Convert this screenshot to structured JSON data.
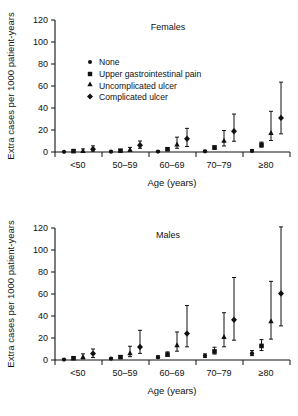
{
  "figure": {
    "background": "#ffffff",
    "ink_color": "#111111",
    "panels": [
      "females",
      "males"
    ]
  },
  "chart_data": [
    {
      "id": "females",
      "type": "scatter",
      "title": "Females",
      "xlabel": "Age (years)",
      "ylabel": "Extra cases per 1000 patient-years",
      "ylim": [
        0,
        120
      ],
      "yticks": [
        0,
        20,
        40,
        60,
        80,
        100,
        120
      ],
      "ytick_labels": [
        "0",
        "20",
        "40",
        "60",
        "80",
        "100",
        "120"
      ],
      "categories": [
        "<50",
        "50–59",
        "60–69",
        "70–79",
        "≥80"
      ],
      "grid": false,
      "legend": {
        "position": "upper-left-inside",
        "entries": [
          {
            "label": "None",
            "marker": "circle"
          },
          {
            "label": "Upper gastrointestinal pain",
            "marker": "square"
          },
          {
            "label": "Uncomplicated ulcer",
            "marker": "triangle"
          },
          {
            "label": "Complicated ulcer",
            "marker": "diamond"
          }
        ]
      },
      "series": [
        {
          "name": "None",
          "marker": "circle",
          "values": [
            0.2,
            0.3,
            0.4,
            0.6,
            1.0
          ],
          "lower": [
            0.0,
            0.0,
            0.0,
            0.1,
            0.3
          ],
          "upper": [
            0.5,
            0.8,
            1.0,
            1.5,
            2.2
          ]
        },
        {
          "name": "Upper gastrointestinal pain",
          "marker": "square",
          "values": [
            0.8,
            1.2,
            2.5,
            4.0,
            6.5
          ],
          "lower": [
            0.2,
            0.4,
            1.4,
            2.6,
            4.4
          ],
          "upper": [
            1.6,
            2.2,
            3.8,
            5.6,
            9.0
          ]
        },
        {
          "name": "Uncomplicated ulcer",
          "marker": "triangle",
          "values": [
            1.2,
            2.2,
            7.0,
            10.5,
            17.5
          ],
          "lower": [
            0.2,
            0.6,
            3.4,
            5.5,
            10.5
          ],
          "upper": [
            2.8,
            4.2,
            13.5,
            19.5,
            37.0
          ]
        },
        {
          "name": "Complicated ulcer",
          "marker": "diamond",
          "values": [
            2.6,
            6.2,
            12.0,
            18.8,
            31.0
          ],
          "lower": [
            0.8,
            3.4,
            5.0,
            9.8,
            16.5
          ],
          "upper": [
            5.6,
            10.0,
            21.5,
            34.5,
            63.5
          ]
        }
      ]
    },
    {
      "id": "males",
      "type": "scatter",
      "title": "Males",
      "xlabel": "Age (years)",
      "ylabel": "Extra cases per 1000 patient-years",
      "ylim": [
        0,
        120
      ],
      "yticks": [
        0,
        20,
        40,
        60,
        80,
        100,
        120
      ],
      "ytick_labels": [
        "0",
        "20",
        "40",
        "60",
        "80",
        "100",
        "120"
      ],
      "categories": [
        "<50",
        "50–59",
        "60–69",
        "70–79",
        "≥80"
      ],
      "grid": false,
      "legend": null,
      "series": [
        {
          "name": "None",
          "marker": "circle",
          "values": [
            0.4,
            1.2,
            2.6,
            3.8,
            6.0
          ],
          "lower": [
            0.0,
            0.5,
            1.6,
            2.4,
            4.0
          ],
          "upper": [
            0.9,
            2.0,
            3.8,
            5.6,
            8.6
          ]
        },
        {
          "name": "Upper gastrointestinal pain",
          "marker": "square",
          "values": [
            1.6,
            2.6,
            5.0,
            7.8,
            12.8
          ],
          "lower": [
            0.8,
            1.4,
            3.4,
            5.4,
            8.6
          ],
          "upper": [
            2.6,
            4.0,
            7.4,
            11.6,
            18.5
          ]
        },
        {
          "name": "Uncomplicated ulcer",
          "marker": "triangle",
          "values": [
            2.8,
            6.4,
            13.5,
            21.0,
            35.5
          ],
          "lower": [
            1.0,
            3.0,
            8.0,
            12.0,
            19.0
          ],
          "upper": [
            5.6,
            12.5,
            25.5,
            43.0,
            71.5
          ]
        },
        {
          "name": "Complicated ulcer",
          "marker": "diamond",
          "values": [
            5.8,
            11.8,
            24.0,
            36.5,
            60.5
          ],
          "lower": [
            2.2,
            6.0,
            12.0,
            18.0,
            31.0
          ],
          "upper": [
            10.0,
            27.0,
            49.5,
            75.0,
            121.0
          ]
        }
      ]
    }
  ]
}
